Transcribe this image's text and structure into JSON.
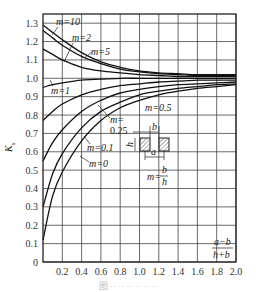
{
  "chart_data": {
    "type": "line",
    "title": "",
    "xlabel": "(a-b)/(h+b)",
    "ylabel": "Ks",
    "xlim": [
      0,
      2.0
    ],
    "ylim": [
      0,
      1.35
    ],
    "grid": true,
    "x_ticks": [
      "0.2",
      "0.4",
      "0.6",
      "0.8",
      "1.0",
      "1.2",
      "1.4",
      "1.6",
      "1.8",
      "2.0"
    ],
    "y_ticks": [
      "0",
      "0.1",
      "0.2",
      "0.3",
      "0.4",
      "0.5",
      "0.6",
      "0.7",
      "0.8",
      "0.9",
      "1.0",
      "1.1",
      "1.2",
      "1.3"
    ],
    "x": [
      0,
      0.1,
      0.2,
      0.4,
      0.6,
      0.8,
      1.0,
      1.2,
      1.4,
      1.6,
      1.8,
      2.0
    ],
    "series": [
      {
        "name": "m=10",
        "values": [
          1.29,
          1.25,
          1.21,
          1.14,
          1.09,
          1.06,
          1.04,
          1.03,
          1.025,
          1.02,
          1.02,
          1.02
        ]
      },
      {
        "name": "m=2",
        "values": [
          1.26,
          1.22,
          1.18,
          1.12,
          1.08,
          1.05,
          1.035,
          1.025,
          1.02,
          1.015,
          1.015,
          1.015
        ]
      },
      {
        "name": "m=5",
        "values": [
          1.16,
          1.13,
          1.1,
          1.06,
          1.04,
          1.03,
          1.02,
          1.015,
          1.01,
          1.01,
          1.01,
          1.01
        ]
      },
      {
        "name": "m=1",
        "values": [
          0.95,
          0.965,
          0.975,
          0.99,
          0.995,
          1.0,
          1.0,
          1.0,
          1.0,
          1.0,
          1.0,
          1.0
        ]
      },
      {
        "name": "m=0.5",
        "values": [
          0.77,
          0.82,
          0.86,
          0.91,
          0.94,
          0.96,
          0.97,
          0.98,
          0.985,
          0.99,
          0.99,
          0.99
        ]
      },
      {
        "name": "m=0.25",
        "values": [
          0.55,
          0.65,
          0.72,
          0.82,
          0.88,
          0.92,
          0.94,
          0.955,
          0.965,
          0.97,
          0.975,
          0.98
        ]
      },
      {
        "name": "m=0.1",
        "values": [
          0.3,
          0.48,
          0.59,
          0.73,
          0.82,
          0.87,
          0.91,
          0.93,
          0.945,
          0.955,
          0.965,
          0.97
        ]
      },
      {
        "name": "m=0",
        "values": [
          0.12,
          0.36,
          0.49,
          0.66,
          0.77,
          0.84,
          0.88,
          0.91,
          0.93,
          0.945,
          0.955,
          0.965
        ]
      }
    ],
    "annotations": [
      "m=10",
      "m=2",
      "m=5",
      "m=1",
      "m=0.5",
      "m=0.25",
      "m=0.1",
      "m=0",
      "m=b/h",
      "a",
      "b",
      "h"
    ],
    "legend_position": "inline labels"
  },
  "labels": {
    "ylabel_main": "K",
    "ylabel_sub": "s",
    "xlabel_num": "a−b",
    "xlabel_den": "h+b",
    "m10": "m=10",
    "m2": "m=2",
    "m5": "m=5",
    "m1": "m=1",
    "m05": "m=0.5",
    "m025_a": "m=",
    "m025_b": "0.25",
    "m01": "m=0.1",
    "m0": "m=0",
    "mdef": "m=",
    "mdef_num": "b",
    "mdef_den": "h",
    "inset_a": "a",
    "inset_b": "b",
    "inset_h": "h"
  },
  "caption": "图 ·· ·· ·· ·· ·· ··"
}
